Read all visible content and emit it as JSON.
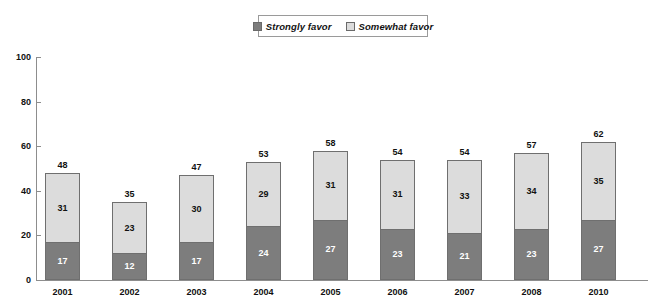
{
  "legend": {
    "items": [
      {
        "label": "Strongly favor",
        "color": "#7d7d7d",
        "key": "strongly"
      },
      {
        "label": "Somewhat favor",
        "color": "#dcdcdc",
        "key": "somewhat"
      }
    ]
  },
  "axis": {
    "y_ticks": [
      "0",
      "20",
      "40",
      "60",
      "80",
      "100"
    ]
  },
  "chart_data": {
    "type": "bar",
    "subtype": "stacked-bar",
    "title": "",
    "subtitle": "",
    "xlabel": "",
    "ylabel": "",
    "ylim": [
      0,
      100
    ],
    "ytick_step": 20,
    "grid": false,
    "legend_position": "top-center",
    "categories": [
      "2001",
      "2002",
      "2003",
      "2004",
      "2005",
      "2006",
      "2007",
      "2008",
      "2010"
    ],
    "series": [
      {
        "name": "Strongly favor",
        "color": "#7d7d7d",
        "values": [
          17,
          12,
          17,
          24,
          27,
          23,
          21,
          23,
          27
        ]
      },
      {
        "name": "Somewhat favor",
        "color": "#dcdcdc",
        "values": [
          31,
          23,
          30,
          29,
          31,
          31,
          33,
          34,
          35
        ]
      }
    ],
    "totals": [
      48,
      35,
      47,
      53,
      58,
      54,
      54,
      57,
      62
    ],
    "annotations": [
      "Totals shown above each bar"
    ]
  }
}
